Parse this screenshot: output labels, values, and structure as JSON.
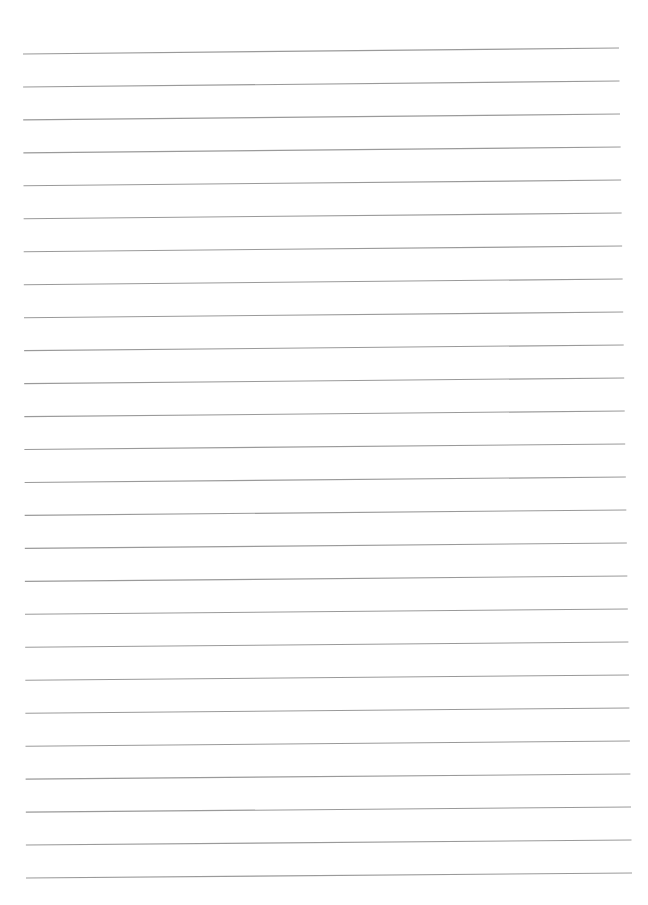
{
  "document": {
    "type": "lined-paper",
    "background": "#ffffff",
    "line_color": "#9a9a9a",
    "line_count": 26,
    "first_line_left": [
      23,
      54
    ],
    "first_line_right": [
      619,
      48
    ],
    "last_line_left": [
      26,
      878
    ],
    "last_line_right": [
      632,
      873
    ],
    "line_spacing": 32.9
  }
}
